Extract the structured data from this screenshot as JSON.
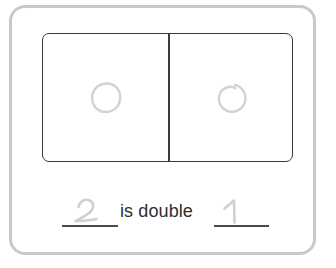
{
  "worksheet": {
    "sentence_text": "is double",
    "blanks": [
      {
        "name": "first-blank",
        "answer": "2",
        "filled": "true"
      },
      {
        "name": "second-blank",
        "answer": "1",
        "filled": "true"
      }
    ],
    "box": {
      "cells": [
        {
          "label": "left-cell",
          "mark_count": "1",
          "mark_shape": "rounded-circle"
        },
        {
          "label": "right-cell",
          "mark_count": "1",
          "mark_shape": "spiral-circle"
        }
      ]
    },
    "colors": {
      "frame": "#c9c9c9",
      "box_outline": "#3a3a3a",
      "text": "#2e2e2e",
      "rule": "#4a4a4a",
      "pencil_mark": "#d2d2d2"
    }
  }
}
